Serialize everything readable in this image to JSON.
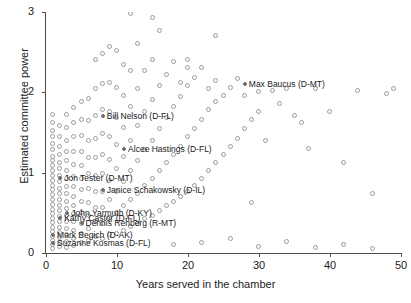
{
  "chart_data": {
    "type": "scatter",
    "title": "",
    "xlabel": "Years served in the chamber",
    "ylabel": "Estimated committee power",
    "xlim": [
      0,
      50
    ],
    "ylim": [
      0,
      3
    ],
    "xticks": [
      "0",
      "10",
      "20",
      "30",
      "40",
      "50"
    ],
    "yticks": [
      "0",
      "1",
      "2",
      "3"
    ],
    "grid": false,
    "legend": "none",
    "marker_style": "open circle (unlabeled), filled gray circle (labeled)",
    "annotations": [
      {
        "label": "Max Baucus (D-MT)",
        "x": 28,
        "y": 2.1
      },
      {
        "label": "Bill Nelson (D-FL)",
        "x": 8,
        "y": 1.7
      },
      {
        "label": "Alcee Hastings (D-FL)",
        "x": 11,
        "y": 1.3
      },
      {
        "label": "Jon Tester (D-MT)",
        "x": 2,
        "y": 0.93
      },
      {
        "label": "Janice Schakowsky (D-IL)",
        "x": 8,
        "y": 0.78
      },
      {
        "label": "John Yarmuth (D-KY)",
        "x": 3,
        "y": 0.5
      },
      {
        "label": "Kathy Castor (D-FL)",
        "x": 2,
        "y": 0.44
      },
      {
        "label": "Dennis Rehberg (R-MT)",
        "x": 5,
        "y": 0.37
      },
      {
        "label": "Mark Begich (D-AK)",
        "x": 1,
        "y": 0.22
      },
      {
        "label": "Suzanne Kosmas (D-FL)",
        "x": 1,
        "y": 0.12
      }
    ],
    "points": [
      [
        1,
        0.05
      ],
      [
        1,
        0.1
      ],
      [
        1,
        0.15
      ],
      [
        1,
        0.2
      ],
      [
        1,
        0.26
      ],
      [
        1,
        0.31
      ],
      [
        1,
        0.37
      ],
      [
        1,
        0.42
      ],
      [
        1,
        0.48
      ],
      [
        1,
        0.54
      ],
      [
        1,
        0.6
      ],
      [
        1,
        0.66
      ],
      [
        1,
        0.72
      ],
      [
        1,
        0.78
      ],
      [
        1,
        0.84
      ],
      [
        1,
        0.9
      ],
      [
        1,
        0.96
      ],
      [
        1,
        1.02
      ],
      [
        1,
        1.08
      ],
      [
        1,
        1.14
      ],
      [
        1,
        1.2
      ],
      [
        1,
        1.28
      ],
      [
        1,
        1.36
      ],
      [
        1,
        1.44
      ],
      [
        1,
        1.52
      ],
      [
        1,
        1.62
      ],
      [
        1,
        1.72
      ],
      [
        2,
        0.07
      ],
      [
        2,
        0.13
      ],
      [
        2,
        0.19
      ],
      [
        2,
        0.25
      ],
      [
        2,
        0.31
      ],
      [
        2,
        0.38
      ],
      [
        2,
        0.45
      ],
      [
        2,
        0.52
      ],
      [
        2,
        0.59
      ],
      [
        2,
        0.66
      ],
      [
        2,
        0.73
      ],
      [
        2,
        0.8
      ],
      [
        2,
        0.88
      ],
      [
        2,
        0.96
      ],
      [
        2,
        1.04
      ],
      [
        2,
        1.12
      ],
      [
        2,
        1.22
      ],
      [
        2,
        1.32
      ],
      [
        2,
        1.44
      ],
      [
        2,
        1.58
      ],
      [
        3,
        0.06
      ],
      [
        3,
        0.14
      ],
      [
        3,
        0.22
      ],
      [
        3,
        0.3
      ],
      [
        3,
        0.38
      ],
      [
        3,
        0.46
      ],
      [
        3,
        0.55
      ],
      [
        3,
        0.64
      ],
      [
        3,
        0.73
      ],
      [
        3,
        0.82
      ],
      [
        3,
        0.92
      ],
      [
        3,
        1.02
      ],
      [
        3,
        1.14
      ],
      [
        3,
        1.26
      ],
      [
        3,
        1.4
      ],
      [
        3,
        1.55
      ],
      [
        3,
        1.72
      ],
      [
        4,
        0.09
      ],
      [
        4,
        0.18
      ],
      [
        4,
        0.28
      ],
      [
        4,
        0.38
      ],
      [
        4,
        0.48
      ],
      [
        4,
        0.58
      ],
      [
        4,
        0.7
      ],
      [
        4,
        0.82
      ],
      [
        4,
        0.95
      ],
      [
        4,
        1.1
      ],
      [
        4,
        1.26
      ],
      [
        4,
        1.44
      ],
      [
        4,
        1.62
      ],
      [
        4,
        1.8
      ],
      [
        5,
        0.12
      ],
      [
        5,
        0.24
      ],
      [
        5,
        0.36
      ],
      [
        5,
        0.5
      ],
      [
        5,
        0.64
      ],
      [
        5,
        0.78
      ],
      [
        5,
        0.92
      ],
      [
        5,
        1.08
      ],
      [
        5,
        1.26
      ],
      [
        5,
        1.46
      ],
      [
        5,
        1.66
      ],
      [
        5,
        1.88
      ],
      [
        6,
        0.15
      ],
      [
        6,
        0.3
      ],
      [
        6,
        0.46
      ],
      [
        6,
        0.62
      ],
      [
        6,
        0.8
      ],
      [
        6,
        0.98
      ],
      [
        6,
        1.18
      ],
      [
        6,
        1.4
      ],
      [
        6,
        1.64
      ],
      [
        6,
        1.92
      ],
      [
        7,
        0.2
      ],
      [
        7,
        0.38
      ],
      [
        7,
        0.56
      ],
      [
        7,
        0.76
      ],
      [
        7,
        0.96
      ],
      [
        7,
        1.18
      ],
      [
        7,
        1.42
      ],
      [
        7,
        1.7
      ],
      [
        7,
        2.04
      ],
      [
        7,
        2.4
      ],
      [
        8,
        0.18
      ],
      [
        8,
        0.36
      ],
      [
        8,
        0.56
      ],
      [
        8,
        0.76
      ],
      [
        8,
        0.98
      ],
      [
        8,
        1.22
      ],
      [
        8,
        1.48
      ],
      [
        8,
        1.78
      ],
      [
        8,
        2.1
      ],
      [
        8,
        2.48
      ],
      [
        9,
        0.22
      ],
      [
        9,
        0.44
      ],
      [
        9,
        0.66
      ],
      [
        9,
        0.9
      ],
      [
        9,
        1.16
      ],
      [
        9,
        1.44
      ],
      [
        9,
        1.76
      ],
      [
        9,
        2.12
      ],
      [
        9,
        2.56
      ],
      [
        10,
        0.24
      ],
      [
        10,
        0.5
      ],
      [
        10,
        0.76
      ],
      [
        10,
        1.04
      ],
      [
        10,
        1.34
      ],
      [
        10,
        1.68
      ],
      [
        10,
        2.06
      ],
      [
        10,
        2.52
      ],
      [
        11,
        0.28
      ],
      [
        11,
        0.58
      ],
      [
        11,
        0.88
      ],
      [
        11,
        1.2
      ],
      [
        11,
        1.56
      ],
      [
        11,
        1.96
      ],
      [
        11,
        2.34
      ],
      [
        12,
        0.32
      ],
      [
        12,
        0.66
      ],
      [
        12,
        1.02
      ],
      [
        12,
        1.4
      ],
      [
        12,
        1.82
      ],
      [
        12,
        2.26
      ],
      [
        12,
        2.98
      ],
      [
        13,
        0.36
      ],
      [
        13,
        0.74
      ],
      [
        13,
        1.14
      ],
      [
        13,
        1.58
      ],
      [
        13,
        2.04
      ],
      [
        13,
        2.6
      ],
      [
        14,
        0.42
      ],
      [
        14,
        0.84
      ],
      [
        14,
        1.28
      ],
      [
        14,
        1.76
      ],
      [
        14,
        2.26
      ],
      [
        15,
        0.46
      ],
      [
        15,
        0.92
      ],
      [
        15,
        1.4
      ],
      [
        15,
        1.9
      ],
      [
        15,
        2.4
      ],
      [
        16,
        0.52
      ],
      [
        16,
        1.02
      ],
      [
        16,
        1.54
      ],
      [
        16,
        2.08
      ],
      [
        16,
        2.76
      ],
      [
        17,
        0.58
      ],
      [
        17,
        1.12
      ],
      [
        17,
        1.68
      ],
      [
        17,
        2.22
      ],
      [
        18,
        0.64
      ],
      [
        18,
        1.22
      ],
      [
        18,
        1.82
      ],
      [
        18,
        2.38
      ],
      [
        19,
        0.7
      ],
      [
        19,
        1.32
      ],
      [
        19,
        1.94
      ],
      [
        19,
        2.12
      ],
      [
        20,
        0.76
      ],
      [
        20,
        1.44
      ],
      [
        20,
        2.08
      ],
      [
        20,
        2.4
      ],
      [
        21,
        0.84
      ],
      [
        21,
        1.54
      ],
      [
        21,
        2.18
      ],
      [
        22,
        0.92
      ],
      [
        22,
        1.66
      ],
      [
        22,
        2.3
      ],
      [
        23,
        1.02
      ],
      [
        23,
        1.78
      ],
      [
        23,
        2.04
      ],
      [
        24,
        1.12
      ],
      [
        24,
        1.88
      ],
      [
        24,
        2.14
      ],
      [
        25,
        1.22
      ],
      [
        25,
        1.96
      ],
      [
        26,
        1.32
      ],
      [
        26,
        2.06
      ],
      [
        27,
        1.42
      ],
      [
        27,
        2.16
      ],
      [
        28,
        1.54
      ],
      [
        28,
        1.96
      ],
      [
        29,
        0.62
      ],
      [
        29,
        1.66
      ],
      [
        30,
        1.76
      ],
      [
        30,
        2.0
      ],
      [
        31,
        1.4
      ],
      [
        32,
        2.02
      ],
      [
        33,
        1.86
      ],
      [
        34,
        2.04
      ],
      [
        35,
        1.7
      ],
      [
        36,
        1.62
      ],
      [
        37,
        1.3
      ],
      [
        38,
        2.04
      ],
      [
        40,
        1.76
      ],
      [
        42,
        1.12
      ],
      [
        44,
        2.02
      ],
      [
        46,
        0.74
      ],
      [
        48,
        1.98
      ],
      [
        49,
        2.04
      ],
      [
        18,
        0.1
      ],
      [
        22,
        0.12
      ],
      [
        26,
        0.18
      ],
      [
        30,
        0.08
      ],
      [
        34,
        0.14
      ],
      [
        38,
        0.06
      ],
      [
        42,
        0.1
      ],
      [
        46,
        0.05
      ],
      [
        15,
        2.92
      ],
      [
        20,
        2.3
      ],
      [
        24,
        2.7
      ]
    ]
  }
}
